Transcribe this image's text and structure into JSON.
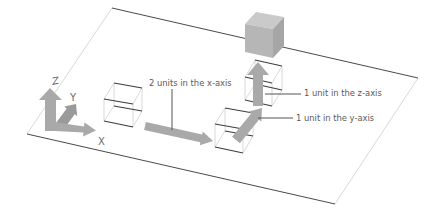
{
  "diagram": {
    "gizmo": {
      "z_label": "Z",
      "y_label": "Y",
      "x_label": "X"
    },
    "annotations": {
      "x_move": "2 units in the x-axis",
      "z_move": "1 unit in the z-axis",
      "y_move": "1 unit in the y-axis"
    },
    "colors": {
      "plane_edge": "#4a4a4a",
      "arrow_fill": "#a9a9a9",
      "cube_top": "#cacaca",
      "cube_front": "#b6b6b6",
      "cube_side": "#a6a6a6",
      "text": "#5a5a5a"
    }
  }
}
